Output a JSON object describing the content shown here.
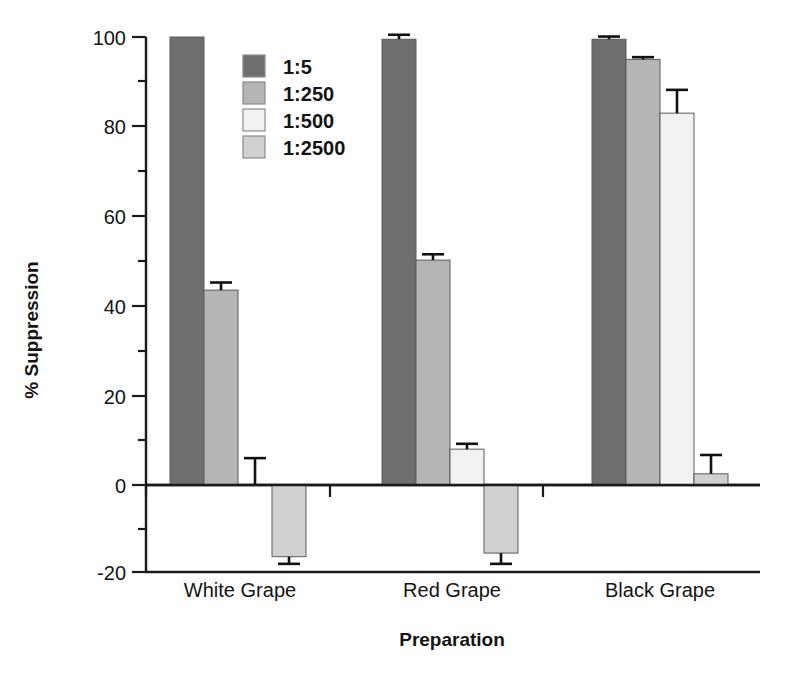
{
  "chart_data": {
    "type": "bar",
    "title": "",
    "xlabel": "Preparation",
    "ylabel": "% Suppression",
    "categories": [
      "White Grape",
      "Red Grape",
      "Black Grape"
    ],
    "ylim": [
      -20,
      100
    ],
    "yticks": [
      -20,
      0,
      20,
      40,
      60,
      80,
      100
    ],
    "ytick_labels": [
      "-20",
      "0",
      "20",
      "40",
      "60",
      "80",
      "100"
    ],
    "yminor_ticks": [
      -10,
      10,
      30,
      50,
      70,
      90
    ],
    "grid": false,
    "legend_position": "upper-left-inside",
    "orientation": "vertical",
    "series": [
      {
        "name": "1:5",
        "color": "#6e6e6e",
        "values": [
          100.0,
          99.5,
          99.5
        ],
        "errors": [
          0.0,
          1.0,
          0.6
        ]
      },
      {
        "name": "1:250",
        "color": "#b5b5b5",
        "values": [
          43.5,
          50.2,
          95.0
        ],
        "errors": [
          1.7,
          1.3,
          0.5
        ]
      },
      {
        "name": "1:500",
        "color": "#f2f2f2",
        "values": [
          0.0,
          8.0,
          83.0
        ],
        "errors": [
          6.0,
          1.2,
          5.2
        ]
      },
      {
        "name": "1:2500",
        "color": "#d0d0d0",
        "values": [
          -16.0,
          -15.2,
          2.5
        ],
        "errors": [
          1.6,
          2.4,
          4.2
        ]
      }
    ]
  },
  "legend": {
    "entries": [
      {
        "label": "1:5"
      },
      {
        "label": "1:250"
      },
      {
        "label": "1:500"
      },
      {
        "label": "1:2500"
      }
    ]
  },
  "axis": {
    "y_title": "% Suppression",
    "x_title": "Preparation",
    "y_tick_100": "100",
    "y_tick_80": "80",
    "y_tick_60": "60",
    "y_tick_40": "40",
    "y_tick_20": "20",
    "y_tick_0": "0",
    "y_tick_neg20": "-20"
  },
  "categories": {
    "c0": "White Grape",
    "c1": "Red Grape",
    "c2": "Black Grape"
  },
  "colors": {
    "series1": "#6e6e6e",
    "series2": "#b5b5b5",
    "series3": "#f2f2f2",
    "series4": "#d0d0d0",
    "axis": "#1a1a1a",
    "background": "#ffffff"
  }
}
